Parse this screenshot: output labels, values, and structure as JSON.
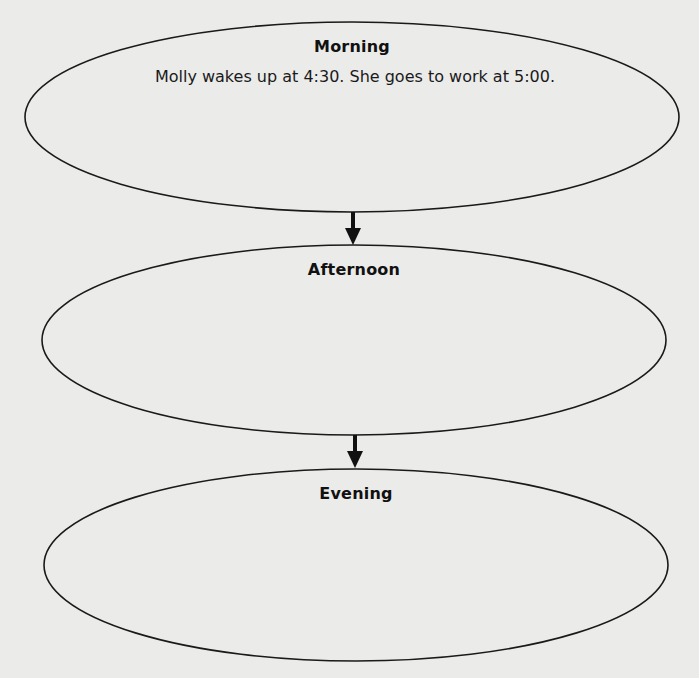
{
  "diagram": {
    "type": "sequence-flow",
    "colors": {
      "background": "#ebebea",
      "stroke": "#1a1a1a",
      "text": "#111111"
    },
    "stages": [
      {
        "title": "Morning",
        "text": "Molly wakes up at 4:30. She goes to work at 5:00."
      },
      {
        "title": "Afternoon",
        "text": ""
      },
      {
        "title": "Evening",
        "text": ""
      }
    ],
    "arrows": [
      {
        "from": "Morning",
        "to": "Afternoon",
        "icon": "down-arrow-icon"
      },
      {
        "from": "Afternoon",
        "to": "Evening",
        "icon": "down-arrow-icon"
      }
    ]
  }
}
